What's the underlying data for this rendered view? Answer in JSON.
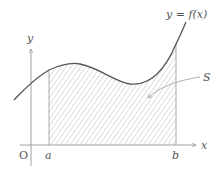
{
  "diagram": {
    "curve_label": "y = f(x)",
    "region_label": "S",
    "axes": {
      "x_label": "x",
      "y_label": "y",
      "origin_label": "O"
    },
    "bounds": {
      "lower_label": "a",
      "upper_label": "b"
    },
    "colors": {
      "curve": "#555555",
      "axis": "#8a8a8a",
      "hatch": "#9a9a9a",
      "text": "#555555"
    }
  }
}
